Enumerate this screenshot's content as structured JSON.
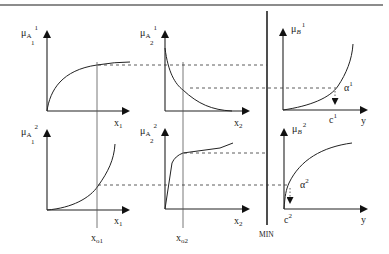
{
  "diagram": {
    "type": "fuzzy-inference-mamdani",
    "combine_operator": "MIN",
    "inputs": {
      "x1": {
        "label": "x",
        "sub": "1",
        "crisp": {
          "label": "x",
          "sub": "o1"
        }
      },
      "x2": {
        "label": "x",
        "sub": "2",
        "crisp": {
          "label": "x",
          "sub": "o2"
        }
      }
    },
    "output_axis": "y",
    "panels": [
      {
        "id": "mu_A11",
        "mu": "μ",
        "set": "A",
        "sup": "1",
        "sub": "1",
        "xlabel": "x",
        "xsub": "1",
        "shape": "concave-increasing"
      },
      {
        "id": "mu_A21",
        "mu": "μ",
        "set": "A",
        "sup": "1",
        "sub": "2",
        "xlabel": "x",
        "xsub": "2",
        "shape": "decreasing"
      },
      {
        "id": "mu_B1",
        "mu": "μ",
        "set": "B",
        "sup": "1",
        "xlabel": "y",
        "shape": "convex-increasing",
        "alpha": {
          "label": "α",
          "sup": "1"
        },
        "c": {
          "label": "c",
          "sup": "1"
        }
      },
      {
        "id": "mu_A12",
        "mu": "μ",
        "set": "A",
        "sup": "2",
        "sub": "1",
        "xlabel": "x",
        "xsub": "1",
        "shape": "convex-increasing"
      },
      {
        "id": "mu_A22",
        "mu": "μ",
        "set": "A",
        "sup": "2",
        "sub": "2",
        "xlabel": "x",
        "xsub": "2",
        "shape": "steep-then-flat"
      },
      {
        "id": "mu_B2",
        "mu": "μ",
        "set": "B",
        "sup": "2",
        "xlabel": "y",
        "shape": "concave-increasing",
        "alpha": {
          "label": "α",
          "sup": "2"
        },
        "c": {
          "label": "c",
          "sup": "2"
        }
      }
    ]
  }
}
